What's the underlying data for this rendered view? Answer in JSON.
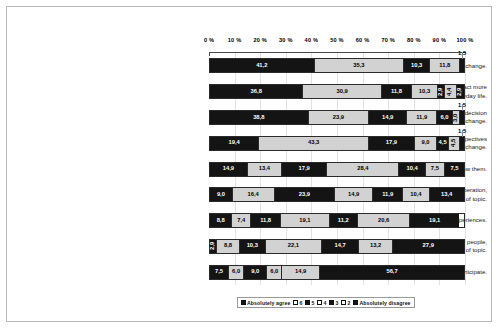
{
  "chart_data": {
    "type": "bar",
    "orientation": "horizontal",
    "stacked": true,
    "normalized_percent": true,
    "title": "",
    "xlabel": "",
    "ylabel": "",
    "xlim": [
      0,
      100
    ],
    "grid": true,
    "legend_position": "bottom",
    "axis_position": "top",
    "tick_labels": [
      "0 %",
      "10 %",
      "20 %",
      "30 %",
      "40 %",
      "50 %",
      "60 %",
      "70 %",
      "80 %",
      "90 %",
      "100 %"
    ],
    "tick_values": [
      0,
      10,
      20,
      30,
      40,
      50,
      60,
      70,
      80,
      90,
      100
    ],
    "legend": [
      {
        "label": "Absolutely agree",
        "fill": "dark"
      },
      {
        "label": "6",
        "fill": "light"
      },
      {
        "label": "5",
        "fill": "dark"
      },
      {
        "label": "4",
        "fill": "light"
      },
      {
        "label": "3",
        "fill": "dark"
      },
      {
        "label": "2",
        "fill": "light"
      },
      {
        "label": "Absolutely disagree",
        "fill": "dark"
      }
    ],
    "categories": [
      "To learn about the subject of climate change.",
      "To learn how I can act more [climate] environmentally-friendly in my everyday life.",
      "To be involved in [societal] decision making on climate change.",
      "To enhance my understanding of alternative perspectives to my personal opinion on climate change.",
      "To meet with other people and get to know them.",
      "To be part of a global citizen deliberation, regardless of topic.",
      "To travel and have new experiences.",
      "To have discussions with other people, regardless of topic.",
      "There is no specific reason why I will participate."
    ],
    "series": [
      {
        "name": "Absolutely agree",
        "values": [
          41.2,
          36.8,
          38.8,
          19.4,
          14.9,
          9.0,
          8.8,
          2.9,
          7.5
        ]
      },
      {
        "name": "6",
        "values": [
          35.3,
          30.9,
          23.9,
          43.3,
          13.4,
          16.4,
          7.4,
          8.8,
          6.0
        ]
      },
      {
        "name": "5",
        "values": [
          10.3,
          11.8,
          14.9,
          17.9,
          17.9,
          23.9,
          11.8,
          10.3,
          9.0
        ]
      },
      {
        "name": "4",
        "values": [
          11.8,
          10.3,
          11.9,
          9.0,
          28.4,
          14.9,
          19.1,
          22.1,
          6.0
        ]
      },
      {
        "name": "3",
        "values": [
          0.0,
          2.9,
          6.0,
          4.5,
          10.4,
          11.9,
          11.2,
          14.7,
          14.9
        ]
      },
      {
        "name": "2",
        "values": [
          0.0,
          4.4,
          3.0,
          4.5,
          7.5,
          10.4,
          20.6,
          13.2,
          0.0
        ]
      },
      {
        "name": "Absolutely disagree",
        "values": [
          1.5,
          2.9,
          1.5,
          1.5,
          7.5,
          13.4,
          19.1,
          27.9,
          56.7
        ]
      }
    ],
    "rows": [
      {
        "label": "To learn about the subject of climate change.",
        "lines": [
          "To learn about the subject of climate change."
        ],
        "segments": [
          {
            "value": "41,2",
            "pct": 41.2,
            "fill": "dark",
            "label_pos": "in"
          },
          {
            "value": "35,3",
            "pct": 35.3,
            "fill": "light",
            "label_pos": "in"
          },
          {
            "value": "10,3",
            "pct": 10.3,
            "fill": "dark",
            "label_pos": "in"
          },
          {
            "value": "11,8",
            "pct": 11.8,
            "fill": "light",
            "label_pos": "in"
          },
          {
            "value": "1,5",
            "pct": 1.5,
            "fill": "dark",
            "label_pos": "out"
          }
        ]
      },
      {
        "label": "To learn how I can act more [climate] environmentally-friendly in my everyday life.",
        "lines": [
          "To learn how I can act more",
          "[climate] environmentally-friendly in my everyday life."
        ],
        "segments": [
          {
            "value": "36,8",
            "pct": 36.8,
            "fill": "dark",
            "label_pos": "in"
          },
          {
            "value": "30,9",
            "pct": 30.9,
            "fill": "light",
            "label_pos": "in"
          },
          {
            "value": "11,8",
            "pct": 11.8,
            "fill": "dark",
            "label_pos": "in"
          },
          {
            "value": "10,3",
            "pct": 10.3,
            "fill": "light",
            "label_pos": "in"
          },
          {
            "value": "2,9",
            "pct": 2.9,
            "fill": "dark",
            "label_pos": "rot"
          },
          {
            "value": "4,4",
            "pct": 4.4,
            "fill": "light",
            "label_pos": "rot"
          },
          {
            "value": "2,9",
            "pct": 2.9,
            "fill": "dark",
            "label_pos": "rot"
          }
        ]
      },
      {
        "label": "To be involved in [societal] decision making on climate change.",
        "lines": [
          "To be involved in [societal] decision",
          "making on climate change."
        ],
        "segments": [
          {
            "value": "38,8",
            "pct": 38.8,
            "fill": "dark",
            "label_pos": "in"
          },
          {
            "value": "23,9",
            "pct": 23.9,
            "fill": "light",
            "label_pos": "in"
          },
          {
            "value": "14,9",
            "pct": 14.9,
            "fill": "dark",
            "label_pos": "in"
          },
          {
            "value": "11,9",
            "pct": 11.9,
            "fill": "light",
            "label_pos": "in"
          },
          {
            "value": "6,0",
            "pct": 6.0,
            "fill": "dark",
            "label_pos": "in"
          },
          {
            "value": "3,0",
            "pct": 3.0,
            "fill": "light",
            "label_pos": "rot"
          },
          {
            "value": "1,5",
            "pct": 1.5,
            "fill": "dark",
            "label_pos": "out"
          }
        ]
      },
      {
        "label": "To enhance my understanding of alternative perspectives to my personal opinion on climate change.",
        "lines": [
          "To enhance my understanding of alternative perspectives",
          "to my personal opinion on climate change."
        ],
        "segments": [
          {
            "value": "19,4",
            "pct": 19.4,
            "fill": "dark",
            "label_pos": "in"
          },
          {
            "value": "43,3",
            "pct": 43.3,
            "fill": "light",
            "label_pos": "in"
          },
          {
            "value": "17,9",
            "pct": 17.9,
            "fill": "dark",
            "label_pos": "in"
          },
          {
            "value": "9,0",
            "pct": 9.0,
            "fill": "light",
            "label_pos": "in"
          },
          {
            "value": "4,5",
            "pct": 4.5,
            "fill": "dark",
            "label_pos": "in"
          },
          {
            "value": "4,5",
            "pct": 4.5,
            "fill": "light",
            "label_pos": "rot"
          },
          {
            "value": "1,5",
            "pct": 1.5,
            "fill": "dark",
            "label_pos": "out"
          }
        ]
      },
      {
        "label": "To meet with other people and get to know them.",
        "lines": [
          "To meet with other people and get to know them."
        ],
        "segments": [
          {
            "value": "14,9",
            "pct": 14.9,
            "fill": "dark",
            "label_pos": "in"
          },
          {
            "value": "13,4",
            "pct": 13.4,
            "fill": "light",
            "label_pos": "in"
          },
          {
            "value": "17,9",
            "pct": 17.9,
            "fill": "dark",
            "label_pos": "in"
          },
          {
            "value": "28,4",
            "pct": 28.4,
            "fill": "light",
            "label_pos": "in"
          },
          {
            "value": "10,4",
            "pct": 10.4,
            "fill": "dark",
            "label_pos": "in"
          },
          {
            "value": "7,5",
            "pct": 7.5,
            "fill": "light",
            "label_pos": "in"
          },
          {
            "value": "7,5",
            "pct": 7.5,
            "fill": "dark",
            "label_pos": "in"
          }
        ]
      },
      {
        "label": "To be part of a global citizen deliberation, regardless of topic.",
        "lines": [
          "To be part of a global citizen deliberation,",
          "regardless of topic."
        ],
        "segments": [
          {
            "value": "9,0",
            "pct": 9.0,
            "fill": "dark",
            "label_pos": "in"
          },
          {
            "value": "16,4",
            "pct": 16.4,
            "fill": "light",
            "label_pos": "in"
          },
          {
            "value": "23,9",
            "pct": 23.9,
            "fill": "dark",
            "label_pos": "in"
          },
          {
            "value": "14,9",
            "pct": 14.9,
            "fill": "light",
            "label_pos": "in"
          },
          {
            "value": "11,9",
            "pct": 11.9,
            "fill": "dark",
            "label_pos": "in"
          },
          {
            "value": "10,4",
            "pct": 10.4,
            "fill": "light",
            "label_pos": "in"
          },
          {
            "value": "13,4",
            "pct": 13.4,
            "fill": "dark",
            "label_pos": "in"
          }
        ]
      },
      {
        "label": "To travel and have new experiences.",
        "lines": [
          "To travel and have new experiences."
        ],
        "segments": [
          {
            "value": "8,8",
            "pct": 8.8,
            "fill": "dark",
            "label_pos": "in"
          },
          {
            "value": "7,4",
            "pct": 7.4,
            "fill": "light",
            "label_pos": "in"
          },
          {
            "value": "11,8",
            "pct": 11.8,
            "fill": "dark",
            "label_pos": "in"
          },
          {
            "value": "19,1",
            "pct": 19.1,
            "fill": "light",
            "label_pos": "in"
          },
          {
            "value": "11,2",
            "pct": 11.2,
            "fill": "dark",
            "label_pos": "in"
          },
          {
            "value": "20,6",
            "pct": 20.6,
            "fill": "light",
            "label_pos": "in"
          },
          {
            "value": "19,1",
            "pct": 19.1,
            "fill": "dark",
            "label_pos": "in"
          }
        ]
      },
      {
        "label": "To have discussions with other people, regardless of topic.",
        "lines": [
          "To have discussions with other people,",
          "regardless of topic."
        ],
        "segments": [
          {
            "value": "2,9",
            "pct": 2.9,
            "fill": "dark",
            "label_pos": "rot"
          },
          {
            "value": "8,8",
            "pct": 8.8,
            "fill": "light",
            "label_pos": "in"
          },
          {
            "value": "10,3",
            "pct": 10.3,
            "fill": "dark",
            "label_pos": "in"
          },
          {
            "value": "22,1",
            "pct": 22.1,
            "fill": "light",
            "label_pos": "in"
          },
          {
            "value": "14,7",
            "pct": 14.7,
            "fill": "dark",
            "label_pos": "in"
          },
          {
            "value": "13,2",
            "pct": 13.2,
            "fill": "light",
            "label_pos": "in"
          },
          {
            "value": "27,9",
            "pct": 27.9,
            "fill": "dark",
            "label_pos": "in"
          }
        ]
      },
      {
        "label": "There is no specific reason why I will participate.",
        "lines": [
          "There is no specific reason why I will participate."
        ],
        "segments": [
          {
            "value": "7,5",
            "pct": 7.5,
            "fill": "dark",
            "label_pos": "in"
          },
          {
            "value": "6,0",
            "pct": 6.0,
            "fill": "light",
            "label_pos": "in"
          },
          {
            "value": "9,0",
            "pct": 9.0,
            "fill": "dark",
            "label_pos": "in"
          },
          {
            "value": "6,0",
            "pct": 6.0,
            "fill": "light",
            "label_pos": "in"
          },
          {
            "value": "14,9",
            "pct": 14.9,
            "fill": "light",
            "label_pos": "in"
          },
          {
            "value": "56,7",
            "pct": 56.7,
            "fill": "dark",
            "label_pos": "in"
          }
        ]
      }
    ]
  }
}
